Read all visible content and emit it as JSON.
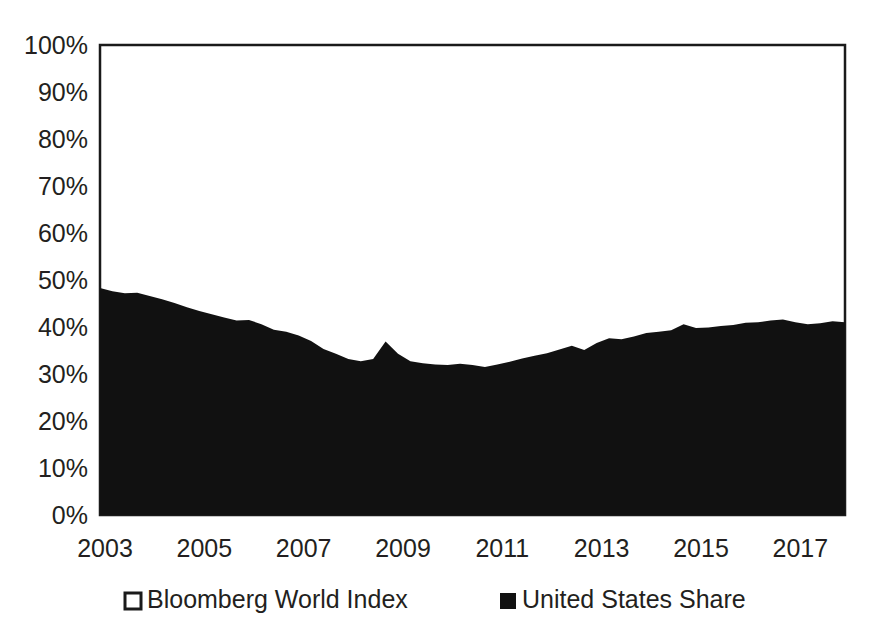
{
  "chart_data": {
    "type": "area",
    "title": "",
    "subtitle": "",
    "xlabel": "",
    "ylabel": "",
    "xlim": [
      2003.0,
      2018.0
    ],
    "ylim": [
      0,
      100
    ],
    "grid": false,
    "legend_position": "bottom",
    "y_ticks": [
      "0%",
      "10%",
      "20%",
      "30%",
      "40%",
      "50%",
      "60%",
      "70%",
      "80%",
      "90%",
      "100%"
    ],
    "y_tick_values": [
      0,
      10,
      20,
      30,
      40,
      50,
      60,
      70,
      80,
      90,
      100
    ],
    "x_ticks": [
      "2003",
      "2005",
      "2007",
      "2009",
      "2011",
      "2013",
      "2015",
      "2017"
    ],
    "x_tick_values": [
      2003,
      2005,
      2007,
      2009,
      2011,
      2013,
      2015,
      2017
    ],
    "series": [
      {
        "name": "Bloomberg World Index",
        "marker": "hollow-square",
        "color": "#ffffff",
        "border_color": "#1a1a1a",
        "note": "Total world index baseline rendered as white area up to 100%",
        "values": [
          100
        ]
      },
      {
        "name": "United States Share",
        "marker": "filled-square",
        "color": "#111111",
        "x": [
          2003.0,
          2003.25,
          2003.5,
          2003.75,
          2004.0,
          2004.25,
          2004.5,
          2004.75,
          2005.0,
          2005.25,
          2005.5,
          2005.75,
          2006.0,
          2006.25,
          2006.5,
          2006.75,
          2007.0,
          2007.25,
          2007.5,
          2007.75,
          2008.0,
          2008.25,
          2008.5,
          2008.75,
          2009.0,
          2009.25,
          2009.5,
          2009.75,
          2010.0,
          2010.25,
          2010.5,
          2010.75,
          2011.0,
          2011.25,
          2011.5,
          2011.75,
          2012.0,
          2012.25,
          2012.5,
          2012.75,
          2013.0,
          2013.25,
          2013.5,
          2013.75,
          2014.0,
          2014.25,
          2014.5,
          2014.75,
          2015.0,
          2015.25,
          2015.5,
          2015.75,
          2016.0,
          2016.25,
          2016.5,
          2016.75,
          2017.0,
          2017.25,
          2017.5,
          2017.75,
          2018.0
        ],
        "values": [
          48.3,
          47.6,
          47.2,
          47.3,
          46.6,
          45.9,
          45.1,
          44.2,
          43.4,
          42.7,
          42.0,
          41.4,
          41.5,
          40.6,
          39.4,
          39.0,
          38.2,
          37.0,
          35.3,
          34.3,
          33.2,
          32.7,
          33.2,
          36.9,
          34.3,
          32.7,
          32.3,
          32.0,
          31.9,
          32.2,
          31.9,
          31.5,
          32.0,
          32.6,
          33.3,
          33.9,
          34.4,
          35.2,
          36.0,
          35.1,
          36.6,
          37.6,
          37.4,
          38.0,
          38.7,
          39.0,
          39.3,
          40.6,
          39.8,
          39.9,
          40.2,
          40.4,
          40.9,
          41.0,
          41.4,
          41.6,
          41.0,
          40.6,
          40.8,
          41.2,
          41.0
        ]
      }
    ],
    "legend": [
      {
        "label": "Bloomberg World Index",
        "marker": "hollow-square"
      },
      {
        "label": "United States Share",
        "marker": "filled-square"
      }
    ]
  }
}
